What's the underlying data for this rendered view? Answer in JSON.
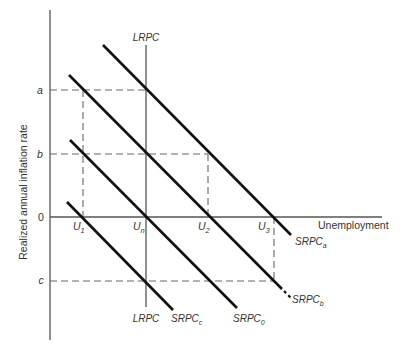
{
  "diagram": {
    "title": "",
    "y_axis_label": "Realized annual inflation rate",
    "x_axis_label": "Unemployment",
    "y_ticks": {
      "a": "a",
      "b": "b",
      "zero": "0",
      "c": "c"
    },
    "x_points": {
      "u1": {
        "base": "U",
        "sub": "1"
      },
      "un": {
        "base": "U",
        "sub": "n"
      },
      "u2": {
        "base": "U",
        "sub": "2"
      },
      "u3": {
        "base": "U",
        "sub": "3"
      }
    },
    "curves": {
      "lrpc_top": "LRPC",
      "lrpc_bottom": "LRPC",
      "srpc_a": {
        "base": "SRPC",
        "sub": "a"
      },
      "srpc_b": {
        "base": "SRPC",
        "sub": "b"
      },
      "srpc_0": {
        "base": "SRPC",
        "sub": "0"
      },
      "srpc_c": {
        "base": "SRPC",
        "sub": "c"
      }
    },
    "colors": {
      "line": "#111111",
      "axis": "#555555",
      "dash": "#666666",
      "text": "#333333"
    }
  }
}
